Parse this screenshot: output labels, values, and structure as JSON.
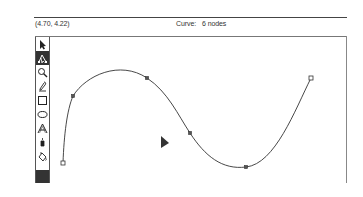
{
  "status_bar": {
    "coordinates": "(4.70, 4.22)",
    "object_type_label": "Curve:",
    "object_info": "6 nodes"
  },
  "toolbox": {
    "tools": [
      {
        "name": "pick-tool",
        "icon": "arrow-pointer-icon",
        "active": false
      },
      {
        "name": "shape-tool",
        "icon": "node-edit-icon",
        "active": true
      },
      {
        "name": "zoom-tool",
        "icon": "magnifier-icon",
        "active": false
      },
      {
        "name": "pencil-tool",
        "icon": "pencil-icon",
        "active": false
      },
      {
        "name": "rectangle-tool",
        "icon": "rectangle-icon",
        "active": false
      },
      {
        "name": "ellipse-tool",
        "icon": "ellipse-icon",
        "active": false
      },
      {
        "name": "text-tool",
        "icon": "text-a-icon",
        "active": false
      },
      {
        "name": "outline-tool",
        "icon": "pen-nib-icon",
        "active": false
      },
      {
        "name": "fill-tool",
        "icon": "paint-bucket-icon",
        "active": false
      }
    ],
    "color_swatch": "#333333"
  },
  "drawing": {
    "curve": {
      "stroke": "#333333",
      "node_count": 6,
      "nodes": [
        {
          "x": 63,
          "y": 163,
          "type": "endpoint"
        },
        {
          "x": 73,
          "y": 96,
          "type": "node"
        },
        {
          "x": 147,
          "y": 78,
          "type": "node"
        },
        {
          "x": 190,
          "y": 133,
          "type": "node"
        },
        {
          "x": 246,
          "y": 167,
          "type": "node"
        },
        {
          "x": 311,
          "y": 78,
          "type": "endpoint"
        }
      ]
    },
    "cursor": {
      "x": 162,
      "y": 137
    }
  },
  "colors": {
    "frame": "#777777",
    "active_tool_bg": "#333333"
  }
}
